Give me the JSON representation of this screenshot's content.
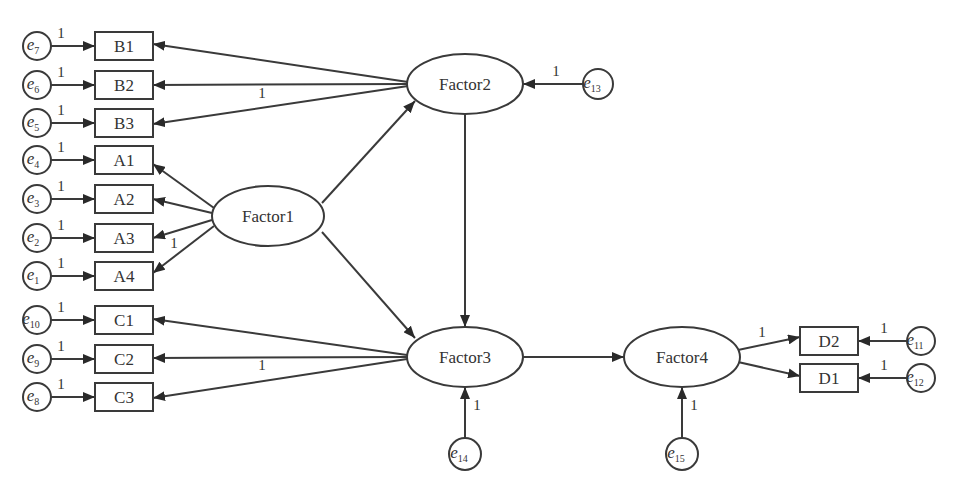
{
  "diagram": {
    "type": "structural-equation-model",
    "colors": {
      "stroke": "#3a3a3a",
      "text": "#333333",
      "background": "#ffffff"
    },
    "latent_factors": [
      {
        "id": "Factor1",
        "label": "Factor1",
        "cx": 268,
        "cy": 216,
        "rx": 56,
        "ry": 30
      },
      {
        "id": "Factor2",
        "label": "Factor2",
        "cx": 465,
        "cy": 84,
        "rx": 58,
        "ry": 30
      },
      {
        "id": "Factor3",
        "label": "Factor3",
        "cx": 465,
        "cy": 357,
        "rx": 58,
        "ry": 30
      },
      {
        "id": "Factor4",
        "label": "Factor4",
        "cx": 682,
        "cy": 357,
        "rx": 58,
        "ry": 30
      }
    ],
    "observed_variables": [
      {
        "id": "B1",
        "label": "B1",
        "x": 95,
        "y": 32,
        "w": 58,
        "h": 28,
        "factor": "Factor2",
        "error": "e7"
      },
      {
        "id": "B2",
        "label": "B2",
        "x": 95,
        "y": 71,
        "w": 58,
        "h": 28,
        "factor": "Factor2",
        "error": "e6"
      },
      {
        "id": "B3",
        "label": "B3",
        "x": 95,
        "y": 109,
        "w": 58,
        "h": 28,
        "factor": "Factor2",
        "error": "e5"
      },
      {
        "id": "A1",
        "label": "A1",
        "x": 95,
        "y": 146,
        "w": 58,
        "h": 28,
        "factor": "Factor1",
        "error": "e4"
      },
      {
        "id": "A2",
        "label": "A2",
        "x": 95,
        "y": 185,
        "w": 58,
        "h": 28,
        "factor": "Factor1",
        "error": "e3"
      },
      {
        "id": "A3",
        "label": "A3",
        "x": 95,
        "y": 224,
        "w": 58,
        "h": 28,
        "factor": "Factor1",
        "error": "e2"
      },
      {
        "id": "A4",
        "label": "A4",
        "x": 95,
        "y": 262,
        "w": 58,
        "h": 28,
        "factor": "Factor1",
        "error": "e1"
      },
      {
        "id": "C1",
        "label": "C1",
        "x": 95,
        "y": 306,
        "w": 58,
        "h": 28,
        "factor": "Factor3",
        "error": "e10"
      },
      {
        "id": "C2",
        "label": "C2",
        "x": 95,
        "y": 345,
        "w": 58,
        "h": 28,
        "factor": "Factor3",
        "error": "e9"
      },
      {
        "id": "C3",
        "label": "C3",
        "x": 95,
        "y": 383,
        "w": 58,
        "h": 28,
        "factor": "Factor3",
        "error": "e8"
      },
      {
        "id": "D2",
        "label": "D2",
        "x": 800,
        "y": 327,
        "w": 58,
        "h": 28,
        "factor": "Factor4",
        "error": "e11"
      },
      {
        "id": "D1",
        "label": "D1",
        "x": 800,
        "y": 364,
        "w": 58,
        "h": 28,
        "factor": "Factor4",
        "error": "e12"
      }
    ],
    "error_terms": [
      {
        "id": "e7",
        "base": "e",
        "sub": "7",
        "cx": 37,
        "cy": 46,
        "r": 14
      },
      {
        "id": "e6",
        "base": "e",
        "sub": "6",
        "cx": 37,
        "cy": 85,
        "r": 14
      },
      {
        "id": "e5",
        "base": "e",
        "sub": "5",
        "cx": 37,
        "cy": 123,
        "r": 14
      },
      {
        "id": "e4",
        "base": "e",
        "sub": "4",
        "cx": 37,
        "cy": 160,
        "r": 14
      },
      {
        "id": "e3",
        "base": "e",
        "sub": "3",
        "cx": 37,
        "cy": 199,
        "r": 14
      },
      {
        "id": "e2",
        "base": "e",
        "sub": "2",
        "cx": 37,
        "cy": 238,
        "r": 14
      },
      {
        "id": "e1",
        "base": "e",
        "sub": "1",
        "cx": 37,
        "cy": 276,
        "r": 14
      },
      {
        "id": "e10",
        "base": "e",
        "sub": "10",
        "cx": 37,
        "cy": 320,
        "r": 14
      },
      {
        "id": "e9",
        "base": "e",
        "sub": "9",
        "cx": 37,
        "cy": 359,
        "r": 14
      },
      {
        "id": "e8",
        "base": "e",
        "sub": "8",
        "cx": 37,
        "cy": 397,
        "r": 14
      },
      {
        "id": "e13",
        "base": "e",
        "sub": "13",
        "cx": 598,
        "cy": 84,
        "r": 15
      },
      {
        "id": "e14",
        "base": "e",
        "sub": "14",
        "cx": 465,
        "cy": 454,
        "r": 16
      },
      {
        "id": "e15",
        "base": "e",
        "sub": "15",
        "cx": 682,
        "cy": 454,
        "r": 16
      },
      {
        "id": "e11",
        "base": "e",
        "sub": "11",
        "cx": 921,
        "cy": 341,
        "r": 14
      },
      {
        "id": "e12",
        "base": "e",
        "sub": "12",
        "cx": 921,
        "cy": 378,
        "r": 14
      }
    ],
    "paths": [
      {
        "from": "e7",
        "to": "B1",
        "x1": 51,
        "y1": 46,
        "x2": 95,
        "y2": 46,
        "weight": "1",
        "lx": 61,
        "ly": 38
      },
      {
        "from": "e6",
        "to": "B2",
        "x1": 51,
        "y1": 85,
        "x2": 95,
        "y2": 85,
        "weight": "1",
        "lx": 61,
        "ly": 77
      },
      {
        "from": "e5",
        "to": "B3",
        "x1": 51,
        "y1": 123,
        "x2": 95,
        "y2": 123,
        "weight": "1",
        "lx": 61,
        "ly": 115
      },
      {
        "from": "e4",
        "to": "A1",
        "x1": 51,
        "y1": 160,
        "x2": 95,
        "y2": 160,
        "weight": "1",
        "lx": 61,
        "ly": 152
      },
      {
        "from": "e3",
        "to": "A2",
        "x1": 51,
        "y1": 199,
        "x2": 95,
        "y2": 199,
        "weight": "1",
        "lx": 61,
        "ly": 191
      },
      {
        "from": "e2",
        "to": "A3",
        "x1": 51,
        "y1": 238,
        "x2": 95,
        "y2": 238,
        "weight": "1",
        "lx": 61,
        "ly": 230
      },
      {
        "from": "e1",
        "to": "A4",
        "x1": 51,
        "y1": 276,
        "x2": 95,
        "y2": 276,
        "weight": "1",
        "lx": 61,
        "ly": 268
      },
      {
        "from": "e10",
        "to": "C1",
        "x1": 51,
        "y1": 320,
        "x2": 95,
        "y2": 320,
        "weight": "1",
        "lx": 61,
        "ly": 312
      },
      {
        "from": "e9",
        "to": "C2",
        "x1": 51,
        "y1": 359,
        "x2": 95,
        "y2": 359,
        "weight": "1",
        "lx": 61,
        "ly": 351
      },
      {
        "from": "e8",
        "to": "C3",
        "x1": 51,
        "y1": 397,
        "x2": 95,
        "y2": 397,
        "weight": "1",
        "lx": 61,
        "ly": 389
      },
      {
        "from": "Factor2",
        "to": "B1",
        "x1": 408,
        "y1": 82,
        "x2": 153,
        "y2": 44,
        "weight": "",
        "lx": 0,
        "ly": 0
      },
      {
        "from": "Factor2",
        "to": "B2",
        "x1": 408,
        "y1": 84,
        "x2": 153,
        "y2": 85,
        "weight": "1",
        "lx": 262,
        "ly": 98
      },
      {
        "from": "Factor2",
        "to": "B3",
        "x1": 408,
        "y1": 86,
        "x2": 153,
        "y2": 124,
        "weight": "",
        "lx": 0,
        "ly": 0
      },
      {
        "from": "Factor1",
        "to": "A1",
        "x1": 214,
        "y1": 208,
        "x2": 153,
        "y2": 164,
        "weight": "",
        "lx": 0,
        "ly": 0
      },
      {
        "from": "Factor1",
        "to": "A2",
        "x1": 212,
        "y1": 213,
        "x2": 153,
        "y2": 199,
        "weight": "",
        "lx": 0,
        "ly": 0
      },
      {
        "from": "Factor1",
        "to": "A3",
        "x1": 212,
        "y1": 220,
        "x2": 153,
        "y2": 238,
        "weight": "",
        "lx": 0,
        "ly": 0
      },
      {
        "from": "Factor1",
        "to": "A4",
        "x1": 214,
        "y1": 226,
        "x2": 153,
        "y2": 273,
        "weight": "1",
        "lx": 174,
        "ly": 248
      },
      {
        "from": "Factor3",
        "to": "C1",
        "x1": 407,
        "y1": 355,
        "x2": 153,
        "y2": 319,
        "weight": "",
        "lx": 0,
        "ly": 0
      },
      {
        "from": "Factor3",
        "to": "C2",
        "x1": 407,
        "y1": 357,
        "x2": 153,
        "y2": 358,
        "weight": "1",
        "lx": 262,
        "ly": 370
      },
      {
        "from": "Factor3",
        "to": "C3",
        "x1": 407,
        "y1": 359,
        "x2": 153,
        "y2": 398,
        "weight": "",
        "lx": 0,
        "ly": 0
      },
      {
        "from": "Factor1",
        "to": "Factor2",
        "x1": 322,
        "y1": 203,
        "x2": 415,
        "y2": 101,
        "weight": "",
        "lx": 0,
        "ly": 0
      },
      {
        "from": "Factor1",
        "to": "Factor3",
        "x1": 322,
        "y1": 232,
        "x2": 415,
        "y2": 338,
        "weight": "",
        "lx": 0,
        "ly": 0
      },
      {
        "from": "Factor2",
        "to": "Factor3",
        "x1": 465,
        "y1": 114,
        "x2": 465,
        "y2": 327,
        "weight": "",
        "lx": 0,
        "ly": 0
      },
      {
        "from": "Factor3",
        "to": "Factor4",
        "x1": 523,
        "y1": 357,
        "x2": 624,
        "y2": 357,
        "weight": "",
        "lx": 0,
        "ly": 0
      },
      {
        "from": "e13",
        "to": "Factor2",
        "x1": 583,
        "y1": 84,
        "x2": 523,
        "y2": 84,
        "weight": "1",
        "lx": 556,
        "ly": 76
      },
      {
        "from": "e14",
        "to": "Factor3",
        "x1": 465,
        "y1": 438,
        "x2": 465,
        "y2": 387,
        "weight": "1",
        "lx": 477,
        "ly": 410
      },
      {
        "from": "e15",
        "to": "Factor4",
        "x1": 682,
        "y1": 438,
        "x2": 682,
        "y2": 387,
        "weight": "1",
        "lx": 694,
        "ly": 410
      },
      {
        "from": "Factor4",
        "to": "D2",
        "x1": 738,
        "y1": 350,
        "x2": 800,
        "y2": 337,
        "weight": "1",
        "lx": 762,
        "ly": 337
      },
      {
        "from": "Factor4",
        "to": "D1",
        "x1": 738,
        "y1": 362,
        "x2": 800,
        "y2": 376,
        "weight": "",
        "lx": 0,
        "ly": 0
      },
      {
        "from": "e11",
        "to": "D2",
        "x1": 907,
        "y1": 341,
        "x2": 858,
        "y2": 341,
        "weight": "1",
        "lx": 884,
        "ly": 333
      },
      {
        "from": "e12",
        "to": "D1",
        "x1": 907,
        "y1": 378,
        "x2": 858,
        "y2": 378,
        "weight": "1",
        "lx": 884,
        "ly": 370
      }
    ]
  }
}
